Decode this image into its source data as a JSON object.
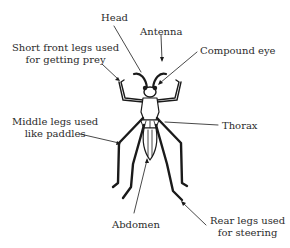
{
  "diagram": {
    "labels": {
      "head": "Head",
      "antenna": "Antenna",
      "compound_eye": "Compound eye",
      "front_legs_line1": "Short front legs used",
      "front_legs_line2": "for getting prey",
      "middle_legs_line1": "Middle legs used",
      "middle_legs_line2": "like paddles",
      "thorax": "Thorax",
      "abdomen": "Abdomen",
      "rear_legs_line1": "Rear legs used",
      "rear_legs_line2": "for steering"
    },
    "colors": {
      "ink": "#1a1a1a",
      "text": "#2b2b2b",
      "background": "#ffffff"
    }
  }
}
